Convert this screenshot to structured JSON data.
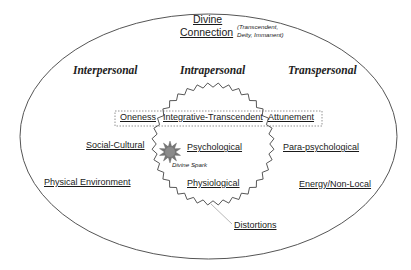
{
  "diagram": {
    "title_line1": "Divine",
    "title_line2": "Connection",
    "title_note_line1": "(Transcendent,",
    "title_note_line2": "Deity, Immanent)",
    "domains": {
      "interpersonal": "Interpersonal",
      "intrapersonal": "Intrapersonal",
      "transpersonal": "Transpersonal"
    },
    "band": {
      "left": "Oneness",
      "center": "Integrative-Transcendent",
      "right": "Attunement"
    },
    "left_items": [
      "Social-Cultural",
      "Physical Environment"
    ],
    "center_items": [
      "Psychological",
      "Physiological"
    ],
    "right_items": [
      "Para-psychological",
      "Energy/Non-Local"
    ],
    "core": "Divine Spark",
    "boundary_label": "Distortions",
    "colors": {
      "outline": "#555555",
      "band_border": "#777777",
      "spark_fill": "#8a8a8a",
      "pointer_line": "#b8b8b8"
    }
  }
}
